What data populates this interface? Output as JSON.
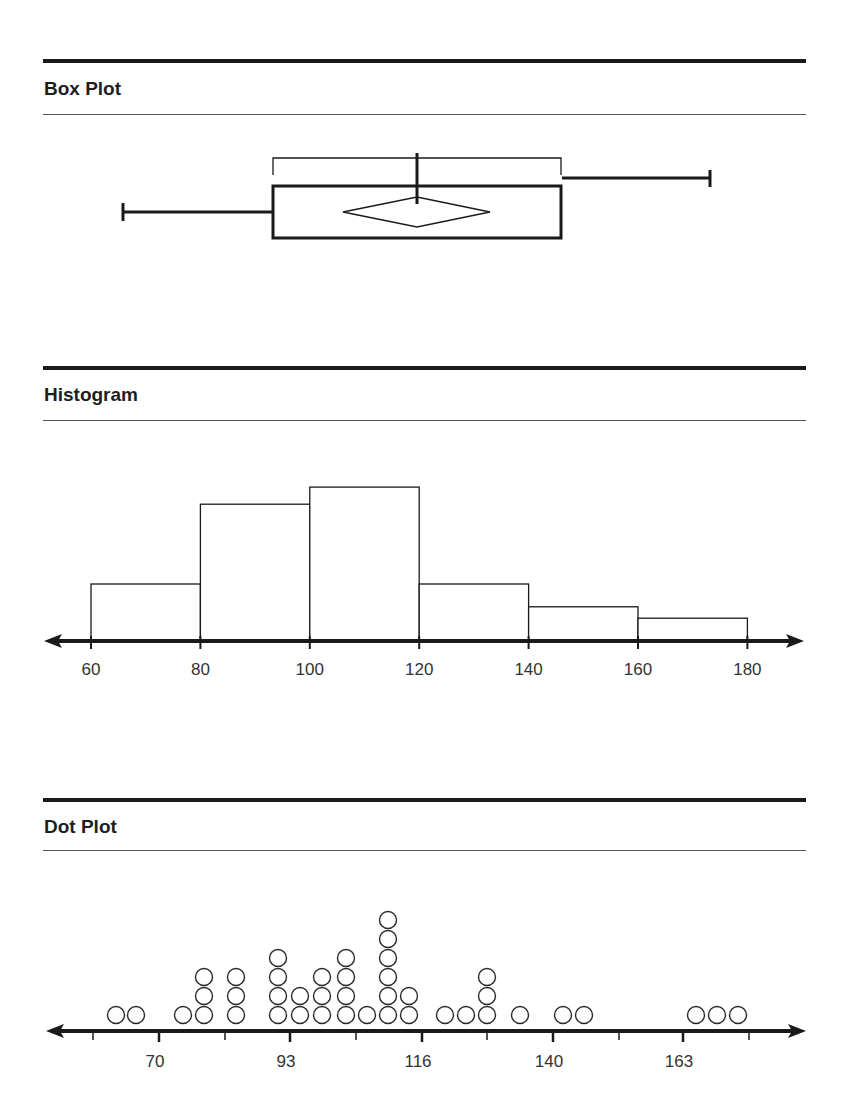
{
  "sections": {
    "box_plot": {
      "title": "Box Plot"
    },
    "histogram": {
      "title": "Histogram"
    },
    "dot_plot": {
      "title": "Dot Plot"
    }
  },
  "colors": {
    "ink": "#1a1a1a",
    "rule_thin": "#555555",
    "background": "#ffffff"
  },
  "chart_data": [
    {
      "type": "box",
      "title": "Box Plot",
      "xlabel": "",
      "ylabel": "",
      "axis_shown": false,
      "estimated_values": {
        "min": 64,
        "q1": 90,
        "median": 115,
        "mean": 115,
        "q3": 140,
        "max": 166
      },
      "pixel_layout": {
        "whisker_min_x": 123,
        "q1_x": 273,
        "median_x": 417,
        "q3_x": 561,
        "whisker_max_x": 710,
        "diamond_left_x": 343,
        "diamond_right_x": 490
      },
      "annotations": [
        "bracket spanning the box (interquartile range)",
        "diamond marks mean and spread"
      ]
    },
    {
      "type": "bar",
      "title": "Histogram",
      "xlabel": "",
      "ylabel": "",
      "bins": [
        [
          60,
          80
        ],
        [
          80,
          100
        ],
        [
          100,
          120
        ],
        [
          120,
          140
        ],
        [
          140,
          160
        ],
        [
          160,
          180
        ]
      ],
      "categories": [
        "60-80",
        "80-100",
        "100-120",
        "120-140",
        "140-160",
        "160-180"
      ],
      "values": [
        5,
        12,
        13.5,
        5,
        3,
        2
      ],
      "x_ticks": [
        "60",
        "80",
        "100",
        "120",
        "140",
        "160",
        "180"
      ],
      "xlim": [
        55,
        190
      ],
      "grid": false,
      "axis_arrows": true
    },
    {
      "type": "scatter",
      "subtype": "dot_plot",
      "title": "Dot Plot",
      "xlabel": "",
      "ylabel": "",
      "x_tick_labels": [
        "70",
        "93",
        "116",
        "140",
        "163"
      ],
      "tick_count": 11,
      "xlim": [
        56,
        182
      ],
      "points": [
        {
          "x": 62,
          "count": 1
        },
        {
          "x": 66,
          "count": 1
        },
        {
          "x": 74,
          "count": 1
        },
        {
          "x": 78,
          "count": 3
        },
        {
          "x": 84,
          "count": 3
        },
        {
          "x": 91,
          "count": 4
        },
        {
          "x": 95,
          "count": 2
        },
        {
          "x": 99,
          "count": 3
        },
        {
          "x": 103,
          "count": 4
        },
        {
          "x": 107,
          "count": 1
        },
        {
          "x": 110,
          "count": 6
        },
        {
          "x": 114,
          "count": 2
        },
        {
          "x": 120,
          "count": 1
        },
        {
          "x": 124,
          "count": 1
        },
        {
          "x": 128,
          "count": 3
        },
        {
          "x": 133,
          "count": 1
        },
        {
          "x": 141,
          "count": 1
        },
        {
          "x": 145,
          "count": 1
        },
        {
          "x": 164,
          "count": 1
        },
        {
          "x": 168,
          "count": 1
        },
        {
          "x": 172,
          "count": 1
        }
      ],
      "grid": false,
      "axis_arrows": true
    }
  ],
  "render": {
    "histogram": {
      "axis_y": 641,
      "x0_px": 91,
      "px_per_unit": 5.47,
      "base_value": 60,
      "bar_px_per_count": 11.4,
      "tick_values": [
        60,
        80,
        100,
        120,
        140,
        160,
        180
      ]
    },
    "dot_plot": {
      "axis_y": 1031,
      "dot_radius": 9,
      "dot_step": 21,
      "tick_px": [
        93,
        159,
        225,
        290,
        356,
        422,
        487,
        553,
        619,
        683,
        749
      ],
      "labeled_ticks": [
        {
          "px": 159,
          "label": "70"
        },
        {
          "px": 290,
          "label": "93"
        },
        {
          "px": 422,
          "label": "116"
        },
        {
          "px": 553,
          "label": "140"
        },
        {
          "px": 683,
          "label": "163"
        }
      ],
      "column_px": [
        116,
        136,
        183,
        204,
        236,
        278,
        300,
        322,
        346,
        367,
        388,
        409,
        445,
        466,
        487,
        520,
        563,
        584,
        696,
        717,
        738
      ]
    }
  }
}
